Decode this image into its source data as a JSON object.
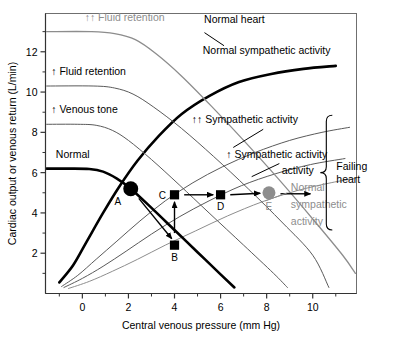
{
  "chart_data": {
    "type": "line",
    "title": "",
    "xlabel": "Central venous pressure (mm Hg)",
    "ylabel": "Cardiac output or venous return (L/min)",
    "xlim": [
      -1.6,
      11.9
    ],
    "ylim": [
      0,
      13.9
    ],
    "xticks": [
      0,
      2,
      4,
      6,
      8,
      10
    ],
    "yticks": [
      2,
      4,
      6,
      8,
      10,
      12
    ],
    "xtick_labels": [
      "0",
      "2",
      "4",
      "6",
      "8",
      "10"
    ],
    "ytick_labels": [
      "2",
      "4",
      "6",
      "8",
      "10",
      "12"
    ],
    "grid": false,
    "legend": "inline-annotations",
    "series": [
      {
        "name": "Normal heart / Normal sympathetic activity",
        "kind": "cardiac-function",
        "color": "#000000",
        "width": 2.6,
        "points": [
          [
            -1.0,
            0.55
          ],
          [
            -0.4,
            1.4
          ],
          [
            0.2,
            2.6
          ],
          [
            0.9,
            4.0
          ],
          [
            1.6,
            5.3
          ],
          [
            2.4,
            6.6
          ],
          [
            3.3,
            7.8
          ],
          [
            4.3,
            8.9
          ],
          [
            5.5,
            9.8
          ],
          [
            6.8,
            10.5
          ],
          [
            8.2,
            10.9
          ],
          [
            9.6,
            11.15
          ],
          [
            11.0,
            11.3
          ]
        ]
      },
      {
        "name": "↑↑ Sympathetic activity",
        "kind": "cardiac-function",
        "color": "#5a5a5a",
        "width": 1.0,
        "points": [
          [
            -0.9,
            0.35
          ],
          [
            -0.2,
            0.9
          ],
          [
            0.6,
            1.7
          ],
          [
            1.5,
            2.6
          ],
          [
            2.5,
            3.6
          ],
          [
            3.6,
            4.6
          ],
          [
            4.8,
            5.5
          ],
          [
            6.1,
            6.3
          ],
          [
            7.5,
            7.0
          ],
          [
            9.0,
            7.6
          ],
          [
            10.4,
            8.0
          ],
          [
            11.6,
            8.25
          ]
        ]
      },
      {
        "name": "↑ Sympathetic activity",
        "kind": "cardiac-function",
        "color": "#5a5a5a",
        "width": 1.0,
        "points": [
          [
            -0.8,
            0.3
          ],
          [
            0.0,
            0.75
          ],
          [
            0.9,
            1.35
          ],
          [
            1.9,
            2.1
          ],
          [
            3.0,
            2.95
          ],
          [
            4.2,
            3.8
          ],
          [
            5.5,
            4.6
          ],
          [
            6.9,
            5.35
          ],
          [
            8.4,
            5.95
          ],
          [
            9.9,
            6.4
          ],
          [
            11.4,
            6.7
          ]
        ]
      },
      {
        "name": "Normal sympathetic activity (failing heart)",
        "kind": "cardiac-function",
        "color": "#8d8d8d",
        "width": 1.0,
        "points": [
          [
            -0.6,
            0.25
          ],
          [
            0.3,
            0.6
          ],
          [
            1.3,
            1.1
          ],
          [
            2.4,
            1.7
          ],
          [
            3.6,
            2.4
          ],
          [
            4.9,
            3.1
          ],
          [
            6.3,
            3.85
          ],
          [
            7.8,
            4.55
          ],
          [
            9.3,
            5.1
          ],
          [
            10.8,
            5.5
          ],
          [
            11.8,
            5.7
          ]
        ]
      },
      {
        "name": "Normal",
        "kind": "venous-return",
        "color": "#000000",
        "width": 2.6,
        "points": [
          [
            -1.55,
            6.2
          ],
          [
            -0.6,
            6.2
          ],
          [
            0.3,
            6.18
          ],
          [
            0.9,
            6.05
          ],
          [
            1.5,
            5.7
          ],
          [
            2.1,
            5.2
          ],
          [
            3.0,
            4.25
          ],
          [
            4.0,
            3.15
          ],
          [
            5.0,
            2.05
          ],
          [
            6.0,
            0.95
          ],
          [
            6.6,
            0.3
          ]
        ]
      },
      {
        "name": "↑ Venous tone",
        "kind": "venous-return",
        "color": "#5a5a5a",
        "width": 1.0,
        "points": [
          [
            -1.55,
            8.4
          ],
          [
            -0.2,
            8.4
          ],
          [
            0.6,
            8.35
          ],
          [
            1.3,
            8.1
          ],
          [
            2.0,
            7.6
          ],
          [
            3.0,
            6.65
          ],
          [
            4.2,
            5.4
          ],
          [
            5.5,
            4.0
          ],
          [
            7.0,
            2.4
          ],
          [
            8.3,
            1.0
          ],
          [
            8.9,
            0.3
          ]
        ]
      },
      {
        "name": "↑ Fluid retention",
        "kind": "venous-return",
        "color": "#5a5a5a",
        "width": 1.0,
        "points": [
          [
            -1.55,
            10.3
          ],
          [
            0.5,
            10.3
          ],
          [
            1.4,
            10.2
          ],
          [
            2.2,
            9.9
          ],
          [
            3.1,
            9.25
          ],
          [
            4.3,
            8.2
          ],
          [
            5.7,
            6.8
          ],
          [
            7.2,
            5.2
          ],
          [
            8.7,
            3.5
          ],
          [
            10.0,
            1.9
          ],
          [
            10.7,
            0.3
          ]
        ]
      },
      {
        "name": "↑↑ Fluid retention",
        "kind": "venous-return",
        "color": "#8d8d8d",
        "width": 1.3,
        "points": [
          [
            -1.55,
            13.0
          ],
          [
            0.4,
            13.0
          ],
          [
            1.4,
            12.9
          ],
          [
            2.3,
            12.6
          ],
          [
            3.2,
            11.9
          ],
          [
            4.3,
            10.8
          ],
          [
            5.6,
            9.3
          ],
          [
            7.0,
            7.6
          ],
          [
            8.5,
            5.7
          ],
          [
            10.0,
            3.7
          ],
          [
            11.3,
            1.9
          ],
          [
            11.85,
            1.0
          ]
        ]
      }
    ],
    "operating_points": [
      {
        "id": "A",
        "x": 2.1,
        "y": 5.2,
        "marker": "circle",
        "size": 7.5,
        "color": "#000000",
        "label": "A",
        "label_pos": "left-below"
      },
      {
        "id": "B",
        "x": 4.0,
        "y": 2.4,
        "marker": "square",
        "size": 4.6,
        "color": "#000000",
        "label": "B",
        "label_pos": "below"
      },
      {
        "id": "C",
        "x": 4.0,
        "y": 4.9,
        "marker": "square",
        "size": 4.6,
        "color": "#000000",
        "label": "C",
        "label_pos": "left"
      },
      {
        "id": "D",
        "x": 6.0,
        "y": 4.9,
        "marker": "square",
        "size": 4.6,
        "color": "#000000",
        "label": "D",
        "label_pos": "below"
      },
      {
        "id": "E",
        "x": 8.1,
        "y": 5.0,
        "marker": "circle",
        "size": 6.5,
        "color": "#8d8d8d",
        "label": "E",
        "label_pos": "below"
      }
    ],
    "arrows": [
      {
        "from": "A",
        "to": "B",
        "x1": 2.45,
        "y1": 4.72,
        "x2": 3.88,
        "y2": 2.72,
        "color": "#000000"
      },
      {
        "from": "B",
        "to": "C",
        "x1": 4.0,
        "y1": 3.0,
        "x2": 4.0,
        "y2": 4.55,
        "color": "#000000"
      },
      {
        "from": "C",
        "to": "D",
        "x1": 4.42,
        "y1": 4.9,
        "x2": 5.68,
        "y2": 4.9,
        "color": "#000000"
      },
      {
        "from": "D",
        "to": "E",
        "x1": 6.42,
        "y1": 4.9,
        "x2": 7.72,
        "y2": 4.98,
        "color": "#000000"
      },
      {
        "from": "E",
        "to": "right",
        "x1": 8.6,
        "y1": 4.95,
        "x2": 9.9,
        "y2": 4.95,
        "color": "#000000"
      }
    ],
    "annotations": [
      {
        "text": "↑↑ Fluid retention",
        "x": 0.1,
        "y": 13.55,
        "color": "#8d8d8d",
        "anchor": "start"
      },
      {
        "text": "↑ Fluid retention",
        "x": -1.35,
        "y": 10.85,
        "color": "#000000",
        "anchor": "start"
      },
      {
        "text": "↑ Venous tone",
        "x": -1.35,
        "y": 8.95,
        "color": "#000000",
        "anchor": "start"
      },
      {
        "text": "Normal",
        "x": -1.15,
        "y": 6.75,
        "color": "#000000",
        "anchor": "start"
      },
      {
        "text": "Normal heart",
        "x": 6.6,
        "y": 13.45,
        "color": "#000000",
        "anchor": "middle"
      },
      {
        "text": "Normal sympathetic activity",
        "x": 8.0,
        "y": 11.9,
        "color": "#000000",
        "anchor": "middle"
      },
      {
        "text": "↑↑ Sympathetic activity",
        "x": 4.75,
        "y": 8.45,
        "color": "#000000",
        "anchor": "start"
      },
      {
        "text": "↑ Sympathetic activity",
        "x": 6.25,
        "y": 6.75,
        "color": "#000000",
        "anchor": "start"
      },
      {
        "text": "activity",
        "x": 9.35,
        "y": 5.95,
        "color": "#000000",
        "anchor": "middle"
      },
      {
        "text": "Normal",
        "x": 9.05,
        "y": 5.1,
        "color": "#8d8d8d",
        "anchor": "start"
      },
      {
        "text": "sympathetic",
        "x": 9.05,
        "y": 4.25,
        "color": "#8d8d8d",
        "anchor": "start"
      },
      {
        "text": "activity",
        "x": 9.05,
        "y": 3.4,
        "color": "#8d8d8d",
        "anchor": "start"
      }
    ],
    "bracket": {
      "label_line1": "Failing",
      "label_line2": "heart",
      "y_top": 8.85,
      "y_bottom": 3.15
    }
  }
}
